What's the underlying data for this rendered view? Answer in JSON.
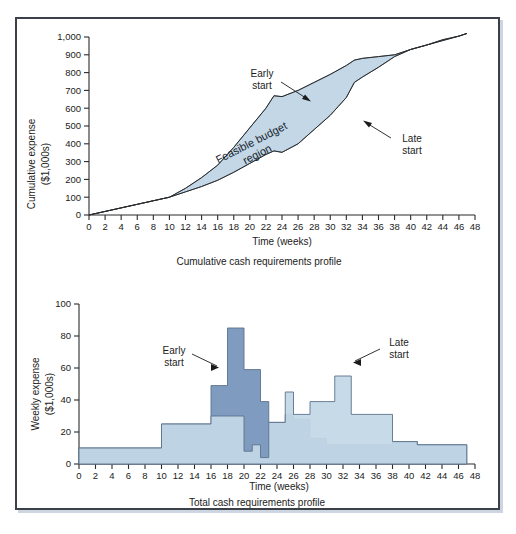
{
  "figure": {
    "panels": [
      {
        "id": "cumulative",
        "caption": "Cumulative cash requirements profile",
        "ylabel_line1": "Cumulative expense",
        "ylabel_line2": "($1,000s)",
        "xlabel": "Time (weeks)",
        "annotations": [
          {
            "name": "early-start",
            "line1": "Early",
            "line2": "start"
          },
          {
            "name": "late-start",
            "line1": "Late",
            "line2": "start"
          },
          {
            "name": "feasible-region",
            "line1": "Feasible budget",
            "line2": "region"
          }
        ]
      },
      {
        "id": "weekly",
        "caption": "Total cash requirements profile",
        "ylabel_line1": "Weekly expense",
        "ylabel_line2": "($1,000s)",
        "xlabel": "Time (weeks)",
        "annotations": [
          {
            "name": "early-start",
            "line1": "Early",
            "line2": "start"
          },
          {
            "name": "late-start",
            "line1": "Late",
            "line2": "start"
          }
        ]
      }
    ],
    "colors": {
      "region_fill": "#c3d7e6",
      "bar_light": "#c3d7e6",
      "bar_dark": "#7f9bc0",
      "outline": "#5b738c",
      "axis": "#2b2b2b",
      "frame": "#3b4049"
    }
  },
  "chart_data": [
    {
      "type": "area",
      "title": "Cumulative cash requirements profile",
      "xlabel": "Time (weeks)",
      "ylabel": "Cumulative expense ($1,000s)",
      "xlim": [
        0,
        48
      ],
      "ylim": [
        0,
        1000
      ],
      "xticks": [
        0,
        2,
        4,
        6,
        8,
        10,
        12,
        14,
        16,
        18,
        20,
        22,
        24,
        26,
        28,
        30,
        32,
        34,
        36,
        38,
        40,
        42,
        44,
        46,
        48
      ],
      "yticks": [
        0,
        100,
        200,
        300,
        400,
        500,
        600,
        700,
        800,
        900,
        1000
      ],
      "ytick_labels": [
        "0",
        "100",
        "200",
        "300",
        "400",
        "500",
        "600",
        "700",
        "800",
        "900",
        "1,000"
      ],
      "grid": false,
      "legend": "annotations-inline",
      "series": [
        {
          "name": "Early start",
          "x": [
            0,
            2,
            4,
            6,
            8,
            10,
            12,
            14,
            16,
            18,
            20,
            22,
            23,
            24,
            26,
            28,
            30,
            32,
            33,
            34,
            36,
            38,
            40,
            42,
            44,
            46,
            47
          ],
          "values": [
            0,
            20,
            40,
            60,
            80,
            100,
            150,
            210,
            280,
            380,
            490,
            600,
            670,
            665,
            700,
            745,
            790,
            840,
            870,
            880,
            890,
            900,
            930,
            955,
            980,
            1005,
            1020
          ]
        },
        {
          "name": "Late start",
          "x": [
            0,
            2,
            4,
            6,
            8,
            10,
            12,
            14,
            16,
            18,
            20,
            22,
            23,
            24,
            26,
            28,
            30,
            31,
            32,
            33,
            34,
            36,
            38,
            40,
            42,
            44,
            46,
            47
          ],
          "values": [
            0,
            20,
            40,
            60,
            80,
            100,
            130,
            160,
            195,
            240,
            290,
            340,
            360,
            352,
            400,
            480,
            560,
            610,
            660,
            745,
            775,
            830,
            890,
            930,
            955,
            985,
            1005,
            1020
          ]
        }
      ],
      "region_label": "Feasible budget region"
    },
    {
      "type": "bar",
      "title": "Total cash requirements profile",
      "xlabel": "Time (weeks)",
      "ylabel": "Weekly expense ($1,000s)",
      "xlim": [
        0,
        48
      ],
      "ylim": [
        0,
        100
      ],
      "xticks": [
        0,
        2,
        4,
        6,
        8,
        10,
        12,
        14,
        16,
        18,
        20,
        22,
        24,
        26,
        28,
        30,
        32,
        34,
        36,
        38,
        40,
        42,
        44,
        46,
        48
      ],
      "yticks": [
        0,
        20,
        40,
        60,
        80,
        100
      ],
      "grid": false,
      "series": [
        {
          "name": "Early start",
          "note": "step profile, dark blue overlay",
          "steps": [
            {
              "x0": 0,
              "x1": 10,
              "value": 10
            },
            {
              "x0": 10,
              "x1": 16,
              "value": 25
            },
            {
              "x0": 16,
              "x1": 17,
              "value": 49
            },
            {
              "x0": 17,
              "x1": 18,
              "value": 49
            },
            {
              "x0": 18,
              "x1": 20,
              "value": 85
            },
            {
              "x0": 20,
              "x1": 22,
              "value": 59
            },
            {
              "x0": 22,
              "x1": 23,
              "value": 39
            },
            {
              "x0": 23,
              "x1": 25,
              "value": 26
            },
            {
              "x0": 25,
              "x1": 26,
              "value": 31
            },
            {
              "x0": 26,
              "x1": 28,
              "value": 28
            },
            {
              "x0": 28,
              "x1": 30,
              "value": 16
            },
            {
              "x0": 30,
              "x1": 38,
              "value": 12
            },
            {
              "x0": 38,
              "x1": 41,
              "value": 14
            },
            {
              "x0": 41,
              "x1": 47,
              "value": 12
            }
          ]
        },
        {
          "name": "Late start",
          "note": "step profile, light blue",
          "steps": [
            {
              "x0": 0,
              "x1": 10,
              "value": 10
            },
            {
              "x0": 10,
              "x1": 16,
              "value": 25
            },
            {
              "x0": 16,
              "x1": 20,
              "value": 30
            },
            {
              "x0": 20,
              "x1": 21,
              "value": 8
            },
            {
              "x0": 21,
              "x1": 22,
              "value": 12
            },
            {
              "x0": 22,
              "x1": 23,
              "value": 4
            },
            {
              "x0": 23,
              "x1": 25,
              "value": 26
            },
            {
              "x0": 25,
              "x1": 26,
              "value": 45
            },
            {
              "x0": 26,
              "x1": 28,
              "value": 31
            },
            {
              "x0": 28,
              "x1": 30,
              "value": 39
            },
            {
              "x0": 30,
              "x1": 31,
              "value": 39
            },
            {
              "x0": 31,
              "x1": 33,
              "value": 55
            },
            {
              "x0": 33,
              "x1": 38,
              "value": 31
            },
            {
              "x0": 38,
              "x1": 41,
              "value": 14
            },
            {
              "x0": 41,
              "x1": 47,
              "value": 12
            }
          ]
        }
      ]
    }
  ]
}
